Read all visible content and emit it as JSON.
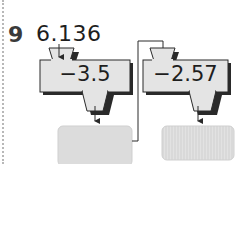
{
  "question": {
    "number": "9",
    "start_value": "6.136"
  },
  "machines": [
    {
      "operation": "−3.5",
      "output_placeholder": ""
    },
    {
      "operation": "−2.57",
      "output_placeholder": ""
    }
  ],
  "colors": {
    "machine_fill": "#e4e4e4",
    "machine_stroke": "#2a2a2a",
    "shadow": "#2a2a2a",
    "output_fill": "#dcdcdc",
    "dotted_border": "#b8b8b8"
  }
}
